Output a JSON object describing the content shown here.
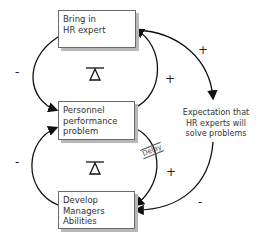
{
  "diagram": {
    "type": "causal-loop",
    "nodes": {
      "hr_expert": {
        "lines": [
          "Bring in",
          "HR expert"
        ]
      },
      "problem": {
        "lines": [
          "Personnel",
          "performance",
          "problem"
        ]
      },
      "develop": {
        "lines": [
          "Develop",
          "Managers",
          "Abilities"
        ]
      },
      "expectation": {
        "lines": [
          "Expectation that",
          "HR experts will",
          "solve problems"
        ]
      }
    },
    "polarities": {
      "hr_to_problem": "-",
      "problem_to_hr": "+",
      "hr_to_expectation": "+",
      "problem_to_develop": "+",
      "develop_to_problem": "-",
      "expectation_to_develop": "-"
    },
    "loops": {
      "upper": "balancing",
      "lower": "balancing"
    },
    "delay_label": "Delay"
  }
}
